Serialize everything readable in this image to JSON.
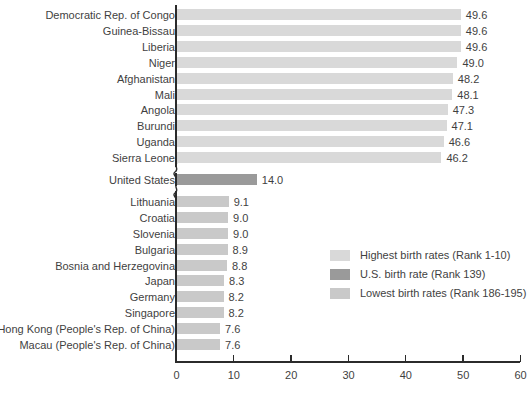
{
  "chart_data": {
    "type": "bar",
    "orientation": "horizontal",
    "title": "",
    "xlabel": "",
    "ylabel": "",
    "xlim": [
      0,
      60
    ],
    "xticks": [
      0,
      10,
      20,
      30,
      40,
      50,
      60
    ],
    "xtick_labels": [
      "0",
      "10",
      "20",
      "30",
      "40",
      "50",
      "60"
    ],
    "grid": false,
    "axis_break": true,
    "categories": [
      "Democratic Rep. of Congo",
      "Guinea-Bissau",
      "Liberia",
      "Niger",
      "Afghanistan",
      "Mali",
      "Angola",
      "Burundi",
      "Uganda",
      "Sierra Leone",
      "United States",
      "Lithuania",
      "Croatia",
      "Slovenia",
      "Bulgaria",
      "Bosnia and Herzegovina",
      "Japan",
      "Germany",
      "Singapore",
      "Hong Kong (People's Rep. of China)",
      "Macau (People's Rep. of China)"
    ],
    "values": [
      49.6,
      49.6,
      49.6,
      49.0,
      48.2,
      48.1,
      47.3,
      47.1,
      46.6,
      46.2,
      14.0,
      9.1,
      9.0,
      9.0,
      8.9,
      8.8,
      8.3,
      8.2,
      8.2,
      7.6,
      7.6
    ],
    "value_labels": [
      "49.6",
      "49.6",
      "49.6",
      "49.0",
      "48.2",
      "48.1",
      "47.3",
      "47.1",
      "46.6",
      "46.2",
      "14.0",
      "9.1",
      "9.0",
      "9.0",
      "8.9",
      "8.8",
      "8.3",
      "8.2",
      "8.2",
      "7.6",
      "7.6"
    ],
    "groups": [
      "high",
      "high",
      "high",
      "high",
      "high",
      "high",
      "high",
      "high",
      "high",
      "high",
      "us",
      "low",
      "low",
      "low",
      "low",
      "low",
      "low",
      "low",
      "low",
      "low",
      "low"
    ],
    "colors": {
      "high": "#d9d9d9",
      "us": "#9a9a9a",
      "low": "#c9c9c9",
      "axis": "#2b2b2b",
      "text": "#3f3f3f"
    },
    "legend": {
      "position": "center-right",
      "entries": [
        {
          "label": "Highest birth rates (Rank 1-10)",
          "group": "high"
        },
        {
          "label": "U.S. birth rate (Rank 139)",
          "group": "us"
        },
        {
          "label": "Lowest birth rates (Rank 186-195)",
          "group": "low"
        }
      ]
    }
  }
}
